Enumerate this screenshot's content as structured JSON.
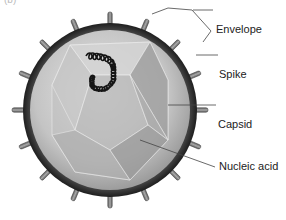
{
  "figure": {
    "panel_label": "(b)",
    "labels": {
      "envelope": "Envelope",
      "spike": "Spike",
      "capsid": "Capsid",
      "nucleic_acid": "Nucleic acid"
    }
  },
  "colors": {
    "envelope_dark": "#2b2b2b",
    "envelope_mid": "#6e6e6e",
    "interior": "#c9c9c9",
    "capsid_face_light": "#d8d8d8",
    "capsid_face_dark": "#9a9a9a",
    "spike": "#7a7a7a",
    "nucleic_acid": "#1a1a1a",
    "leader_line": "#444444"
  }
}
